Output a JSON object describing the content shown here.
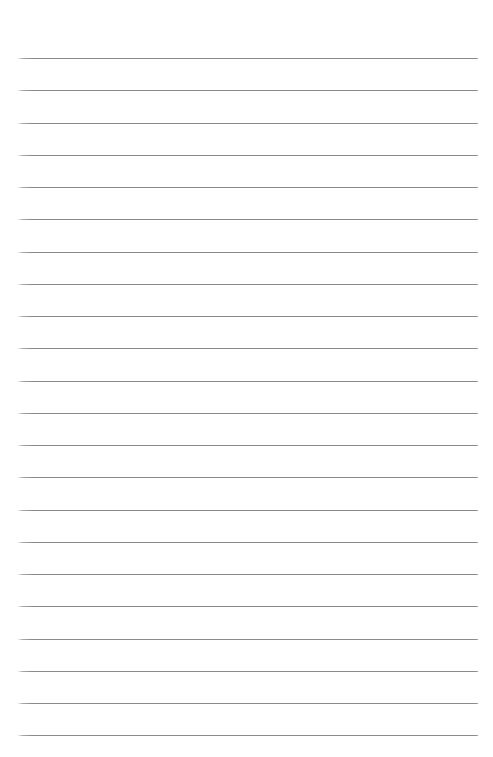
{
  "document": {
    "kind": "lined-paper",
    "title": "Blank Ruled Writing Paper",
    "page_number_label": "",
    "header_text": "",
    "footer_text": "",
    "body_text": ""
  },
  "page": {
    "width": 493,
    "height": 757,
    "background_color": "#ffffff"
  },
  "rules": {
    "count": 22,
    "color": "#8a8a8a",
    "thickness_px": 1,
    "left_x": 18,
    "right_x": 478,
    "length_px": 460,
    "first_y": 58,
    "spacing_px": 32.25,
    "y_positions": [
      58,
      90.3,
      122.5,
      154.8,
      187,
      219.3,
      251.5,
      283.8,
      316,
      348.3,
      380.5,
      412.8,
      445,
      477.3,
      509.5,
      541.8,
      574,
      606.3,
      638.5,
      670.8,
      703,
      735.3
    ]
  },
  "margins": {
    "top_px": 58,
    "bottom_px": 22,
    "left_px": 18,
    "right_px": 15
  },
  "rows": {
    "values": [
      "",
      "",
      "",
      "",
      "",
      "",
      "",
      "",
      "",
      "",
      "",
      "",
      "",
      "",
      "",
      "",
      "",
      "",
      "",
      "",
      "",
      ""
    ]
  }
}
